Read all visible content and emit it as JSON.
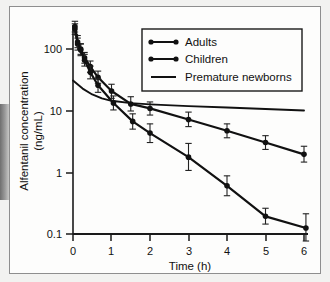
{
  "chart_data": {
    "type": "line",
    "title": "",
    "xlabel": "Time (h)",
    "ylabel": "Alfentanil concentration (ng/mL)",
    "ylabel_line1": "Alfentanil concentration",
    "ylabel_line2": "(ng/mL)",
    "yscale": "log",
    "xlim": [
      0,
      6.2
    ],
    "ylim": [
      0.1,
      300
    ],
    "xticks": [
      0,
      1,
      2,
      3,
      4,
      5,
      6
    ],
    "xticklabels": [
      "0",
      "1",
      "2",
      "3",
      "4",
      "5",
      "6"
    ],
    "yticks": [
      0.1,
      1,
      10,
      100
    ],
    "yticklabels": [
      "0.1",
      "1",
      "10",
      "100"
    ],
    "grid": false,
    "legend_position": "upper right",
    "series": [
      {
        "name": "Adults",
        "marker": "filled-circle",
        "x": [
          0.05,
          0.12,
          0.2,
          0.3,
          0.45,
          0.65,
          1.0,
          1.5,
          2.0,
          3.0,
          4.0,
          5.0,
          6.0
        ],
        "values": [
          210,
          120,
          100,
          72,
          52,
          35,
          21,
          13,
          11,
          7.3,
          4.8,
          3.1,
          2.0
        ],
        "err_up": [
          255,
          150,
          122,
          88,
          64,
          44,
          27,
          17,
          14,
          9.6,
          6.2,
          4.0,
          2.7
        ],
        "err_down": [
          172,
          96,
          82,
          59,
          42,
          28,
          16,
          10,
          8.6,
          5.6,
          3.7,
          2.4,
          1.5
        ]
      },
      {
        "name": "Children",
        "marker": "filled-circle",
        "x": [
          0.05,
          0.12,
          0.2,
          0.3,
          0.45,
          0.65,
          1.05,
          1.55,
          2.0,
          3.0,
          4.0,
          5.0,
          6.05
        ],
        "values": [
          230,
          130,
          96,
          66,
          42,
          26,
          13.5,
          6.8,
          4.4,
          1.8,
          0.62,
          0.2,
          0.13
        ],
        "err_up": [
          280,
          165,
          120,
          82,
          53,
          33,
          17.5,
          9.0,
          6.2,
          3.0,
          0.9,
          0.27,
          0.22
        ],
        "err_down": [
          188,
          105,
          78,
          53,
          33,
          20,
          10.4,
          5.1,
          3.1,
          1.1,
          0.43,
          0.15,
          0.08
        ]
      },
      {
        "name": "Premature newborns",
        "marker": "none",
        "x": [
          0.0,
          0.25,
          0.5,
          0.75,
          1.0,
          1.5,
          2.0,
          3.0,
          4.0,
          5.0,
          6.0
        ],
        "values": [
          31,
          23,
          18.5,
          16,
          14.6,
          13.4,
          12.8,
          12.0,
          11.4,
          10.8,
          10.2
        ]
      }
    ]
  },
  "legend": {
    "entries": [
      {
        "label": "Adults",
        "style": "line-with-dots"
      },
      {
        "label": "Children",
        "style": "line-with-dots"
      },
      {
        "label": "Premature newborns",
        "style": "plain-line"
      }
    ]
  }
}
